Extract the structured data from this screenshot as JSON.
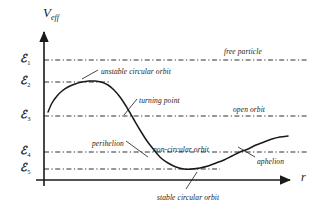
{
  "figure": {
    "type": "effective-potential-diagram",
    "background": "#ffffff",
    "ink_color": "#1a1a1a"
  },
  "axes": {
    "y_label_main": "V",
    "y_label_sub": "eff",
    "x_label": "r",
    "origin": {
      "x": 44,
      "y": 180
    },
    "x_end": 296,
    "y_top": 26
  },
  "energy_levels": [
    {
      "symbol": "ℰ",
      "sub": "1",
      "y": 60,
      "label_x": 20,
      "label_y": 53,
      "line_x1": 44,
      "line_x2": 307
    },
    {
      "symbol": "ℰ",
      "sub": "2",
      "y": 82,
      "label_x": 20,
      "label_y": 75,
      "line_x1": 44,
      "line_x2": 110
    },
    {
      "symbol": "ℰ",
      "sub": "3",
      "y": 116,
      "label_x": 20,
      "label_y": 109,
      "line_x1": 44,
      "line_x2": 307
    },
    {
      "symbol": "ℰ",
      "sub": "4",
      "y": 152,
      "label_x": 20,
      "label_y": 145,
      "line_x1": 44,
      "line_x2": 307
    },
    {
      "symbol": "ℰ",
      "sub": "5",
      "y": 169,
      "label_x": 20,
      "label_y": 162,
      "line_x1": 44,
      "line_x2": 220
    }
  ],
  "annotations": [
    {
      "id": "free-particle",
      "text": "free particle",
      "x": 224,
      "y": 48
    },
    {
      "id": "unstable-circular-orbit",
      "text": "unstable circular orbit",
      "x": 101,
      "y": 68
    },
    {
      "id": "turning-point",
      "text": "turning point",
      "x": 139,
      "y": 97
    },
    {
      "id": "open-orbit",
      "text": "open orbit",
      "x": 233,
      "y": 106
    },
    {
      "id": "perihelion",
      "text": "perihelion",
      "x": 92,
      "y": 140
    },
    {
      "id": "non-circular-orbit",
      "text": "non-circular orbit",
      "x": 153,
      "y": 146
    },
    {
      "id": "aphelion",
      "text": "aphelion",
      "x": 257,
      "y": 158
    },
    {
      "id": "stable-circular-orbit",
      "text": "stable circular orbit",
      "x": 157,
      "y": 194
    }
  ],
  "leader_lines": [
    {
      "id": "leader-unstable-circular-orbit",
      "x1": 98,
      "y1": 70,
      "x2": 82,
      "y2": 79
    },
    {
      "id": "leader-turning-point",
      "x1": 137,
      "y1": 99,
      "x2": 124,
      "y2": 115
    },
    {
      "id": "leader-perihelion",
      "x1": 126,
      "y1": 141,
      "x2": 148,
      "y2": 157
    },
    {
      "id": "leader-aphelion",
      "x1": 255,
      "y1": 157,
      "x2": 238,
      "y2": 147
    },
    {
      "id": "leader-stable-circular-orbit",
      "x1": 186,
      "y1": 189,
      "x2": 197,
      "y2": 172
    }
  ],
  "chart_data": {
    "type": "line",
    "xlabel": "r",
    "ylabel": "V_eff",
    "grid": false,
    "legend": null,
    "curve_name": "effective potential",
    "points": [
      [
        48,
        112
      ],
      [
        52,
        103
      ],
      [
        57,
        96
      ],
      [
        62,
        91
      ],
      [
        68,
        87
      ],
      [
        75,
        84
      ],
      [
        82,
        82
      ],
      [
        89,
        81
      ],
      [
        95,
        81
      ],
      [
        101,
        82
      ],
      [
        108,
        85
      ],
      [
        114,
        90
      ],
      [
        120,
        97
      ],
      [
        126,
        106
      ],
      [
        133,
        118
      ],
      [
        140,
        130
      ],
      [
        147,
        141
      ],
      [
        154,
        150
      ],
      [
        161,
        158
      ],
      [
        168,
        163
      ],
      [
        176,
        167
      ],
      [
        184,
        169
      ],
      [
        192,
        169
      ],
      [
        200,
        168
      ],
      [
        208,
        166
      ],
      [
        216,
        163
      ],
      [
        224,
        160
      ],
      [
        232,
        156
      ],
      [
        240,
        152
      ],
      [
        248,
        149
      ],
      [
        256,
        145
      ],
      [
        264,
        142
      ],
      [
        272,
        139
      ],
      [
        280,
        137
      ],
      [
        288,
        136
      ]
    ],
    "annotated_features": {
      "maximum": {
        "label": "unstable circular orbit",
        "energy": "ℰ2"
      },
      "minimum": {
        "label": "stable circular orbit",
        "energy": "ℰ5"
      },
      "crossing_E3": {
        "label": "turning point"
      },
      "crossing_E4_inner": {
        "label": "perihelion"
      },
      "crossing_E4_outer": {
        "label": "aphelion"
      },
      "level_E1": {
        "label": "free particle"
      },
      "level_E3": {
        "label": "open orbit"
      },
      "level_E4": {
        "label": "non-circular orbit"
      }
    }
  }
}
